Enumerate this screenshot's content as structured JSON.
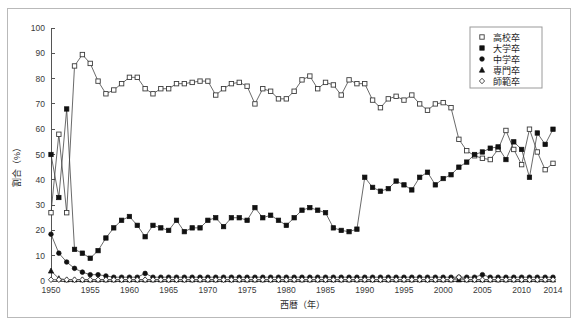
{
  "figure": {
    "background_color": "#ffffff",
    "frame_color": "#b9b9b9",
    "axis_color": "#555555"
  },
  "chart_data": {
    "type": "line",
    "title": "",
    "subtitle": "",
    "xlabel": "西暦（年）",
    "ylabel": "割合（%）",
    "xlim": [
      1950,
      2014
    ],
    "ylim": [
      0,
      100
    ],
    "grid": false,
    "legend_position": "top-right",
    "x_tick_labels": [
      "1950",
      "1955",
      "1960",
      "1965",
      "1970",
      "1975",
      "1980",
      "1985",
      "1990",
      "1995",
      "2000",
      "2005",
      "2010",
      "2014"
    ],
    "x_ticks": [
      1950,
      1955,
      1960,
      1965,
      1970,
      1975,
      1980,
      1985,
      1990,
      1995,
      2000,
      2005,
      2010,
      2014
    ],
    "y_tick_labels": [
      "0",
      "10",
      "20",
      "30",
      "40",
      "50",
      "60",
      "70",
      "80",
      "90",
      "100"
    ],
    "y_ticks": [
      0,
      10,
      20,
      30,
      40,
      50,
      60,
      70,
      80,
      90,
      100
    ],
    "x": [
      1950,
      1951,
      1952,
      1953,
      1954,
      1955,
      1956,
      1957,
      1958,
      1959,
      1960,
      1961,
      1962,
      1963,
      1964,
      1965,
      1966,
      1967,
      1968,
      1969,
      1970,
      1971,
      1972,
      1973,
      1974,
      1975,
      1976,
      1977,
      1978,
      1979,
      1980,
      1981,
      1982,
      1983,
      1984,
      1985,
      1986,
      1987,
      1988,
      1989,
      1990,
      1991,
      1992,
      1993,
      1994,
      1995,
      1996,
      1997,
      1998,
      1999,
      2000,
      2001,
      2002,
      2003,
      2004,
      2005,
      2006,
      2007,
      2008,
      2009,
      2010,
      2011,
      2012,
      2013,
      2014
    ],
    "series": [
      {
        "name": "高校卒",
        "marker": "open-square",
        "values": [
          27,
          58,
          27,
          85,
          89.5,
          86,
          79,
          74,
          75.5,
          78,
          80.5,
          80.5,
          76,
          74,
          76,
          76,
          78,
          78,
          78.5,
          79,
          79,
          73.5,
          76,
          78,
          78.5,
          77,
          70,
          76,
          75,
          72,
          72,
          75,
          79.5,
          81,
          76,
          78.5,
          77.5,
          73.5,
          79.5,
          78,
          78,
          71.5,
          68.5,
          72,
          73,
          71.5,
          73.5,
          70,
          67.5,
          70,
          70.5,
          68.5,
          56,
          51.5,
          49.5,
          48.5,
          48,
          52,
          59.5,
          52,
          46,
          60,
          51,
          44,
          46.5
        ]
      },
      {
        "name": "大学卒",
        "marker": "filled-square",
        "values": [
          50,
          33,
          68,
          12.5,
          11,
          9,
          12,
          17,
          21,
          24,
          25.5,
          22,
          17.5,
          22,
          21,
          20,
          24,
          19.5,
          21,
          21,
          24,
          25,
          21.5,
          25,
          25,
          24,
          29,
          25,
          26,
          24,
          22,
          25,
          28,
          29,
          28,
          27,
          21,
          20,
          19.5,
          20.5,
          41,
          37,
          35.5,
          36.5,
          39.5,
          38,
          36,
          41,
          43,
          38,
          40.5,
          42,
          45,
          47,
          50,
          51,
          52.5,
          53,
          48,
          55,
          52,
          41,
          58.5,
          54,
          60
        ]
      },
      {
        "name": "中学卒",
        "marker": "filled-circle",
        "values": [
          18.5,
          11,
          7.5,
          5,
          3.5,
          2.5,
          2.5,
          2,
          1.5,
          1.5,
          1.5,
          1.5,
          3,
          1.5,
          1.5,
          1.5,
          1.5,
          1.5,
          1.5,
          1.5,
          1.5,
          1.5,
          1.5,
          1.5,
          1.5,
          1.5,
          1.5,
          1.5,
          1.5,
          1.5,
          1.5,
          1.5,
          1.5,
          1.5,
          1.5,
          1.5,
          1.5,
          1.5,
          1.5,
          1.5,
          1.5,
          1.5,
          1.5,
          1.5,
          1.5,
          1.5,
          1.5,
          1.5,
          1.5,
          1.5,
          1.5,
          1.5,
          1.5,
          1.5,
          1.5,
          2.5,
          1.5,
          1.5,
          1.5,
          1.5,
          1.5,
          1.5,
          1.5,
          1.5,
          1.5
        ]
      },
      {
        "name": "専門卒",
        "marker": "filled-triangle",
        "values": [
          4,
          1,
          0.5,
          0.5,
          0.5,
          0.5,
          0.5,
          0.5,
          0.5,
          0.5,
          0.5,
          0.5,
          0.5,
          0.5,
          0.5,
          0.5,
          0.5,
          0.5,
          0.5,
          0.5,
          0.5,
          0.5,
          0.5,
          0.5,
          0.5,
          0.5,
          0.5,
          0.5,
          0.5,
          0.5,
          0.5,
          0.5,
          0.5,
          0.5,
          0.5,
          0.5,
          0.5,
          0.5,
          0.5,
          0.5,
          0.5,
          0.5,
          0.5,
          0.5,
          0.5,
          0.5,
          0.5,
          0.5,
          0.5,
          0.5,
          0.5,
          0.5,
          0.5,
          0.5,
          0.5,
          0.5,
          0.5,
          0.5,
          0.5,
          0.5,
          0.5,
          0.5,
          0.5,
          0.5,
          0.5
        ]
      },
      {
        "name": "師範卒",
        "marker": "open-diamond",
        "values": [
          0.5,
          0.5,
          0.5,
          0.5,
          0.5,
          0.5,
          0.5,
          0.5,
          0.5,
          0.5,
          0.5,
          0.5,
          0.5,
          0.5,
          0.5,
          0.5,
          0.5,
          0.5,
          0.5,
          0.5,
          0.5,
          0.5,
          0.5,
          0.5,
          0.5,
          0.5,
          0.5,
          0.5,
          0.5,
          0.5,
          0.5,
          0.5,
          0.5,
          0.5,
          0.5,
          0.5,
          0.5,
          0.5,
          0.5,
          0.5,
          0.5,
          0.5,
          0.5,
          0.5,
          0.5,
          0.5,
          0.5,
          0.5,
          0.5,
          0.5,
          0.5,
          0.5,
          1.5,
          0.5,
          0.5,
          0.5,
          0.5,
          0.5,
          0.5,
          0.5,
          0.5,
          0.5,
          0.5,
          0.5,
          0.5
        ]
      }
    ]
  },
  "legend": {
    "items": [
      {
        "label": "高校卒",
        "marker": "open-square"
      },
      {
        "label": "大学卒",
        "marker": "filled-square"
      },
      {
        "label": "中学卒",
        "marker": "filled-circle"
      },
      {
        "label": "専門卒",
        "marker": "filled-triangle"
      },
      {
        "label": "師範卒",
        "marker": "open-diamond"
      }
    ]
  }
}
